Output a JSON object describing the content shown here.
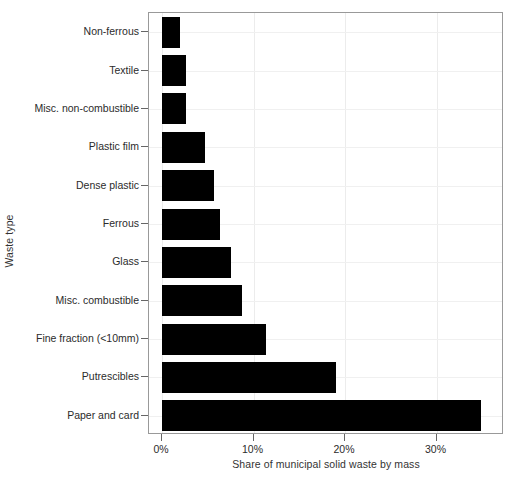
{
  "chart_data": {
    "type": "bar",
    "orientation": "horizontal",
    "title": "",
    "xlabel": "Share of municipal solid waste by mass",
    "ylabel": "Waste type",
    "categories": [
      "Non-ferrous",
      "Textile",
      "Misc. non-combustible",
      "Plastic film",
      "Dense plastic",
      "Ferrous",
      "Glass",
      "Misc. combustible",
      "Fine fraction (<10mm)",
      "Putrescibles",
      "Paper and card"
    ],
    "values": [
      2.0,
      2.6,
      2.6,
      4.7,
      5.7,
      6.3,
      7.5,
      8.7,
      11.4,
      19.0,
      34.9
    ],
    "value_unit": "%",
    "xlim": [
      0,
      38.5
    ],
    "xticks": [
      0,
      10,
      20,
      30
    ],
    "xtick_labels": [
      "0%",
      "10%",
      "20%",
      "30%"
    ],
    "grid": "light-gray major gridlines, horizontal and vertical",
    "legend": "none",
    "bar_color": "#000000",
    "panel_border_color": "#999999",
    "grid_color": "#ececec",
    "background_color": "#ffffff"
  }
}
